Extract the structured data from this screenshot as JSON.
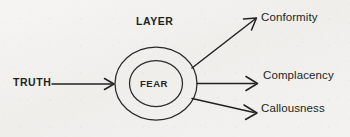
{
  "diagram": {
    "title_label": "LAYER",
    "center_label": "FEAR",
    "input_label": "TRUTH",
    "outputs": [
      {
        "label": "Conformity"
      },
      {
        "label": "Complacency"
      },
      {
        "label": "Callousness"
      }
    ],
    "colors": {
      "ink": "#232220",
      "paper": "#f3f2f0"
    }
  }
}
